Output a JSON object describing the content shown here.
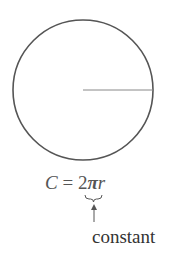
{
  "diagram": {
    "circle": {
      "cx": 83,
      "cy": 90,
      "r": 70,
      "stroke": "#555555"
    },
    "radius_line": {
      "x1": 83,
      "y1": 90,
      "x2": 153,
      "y2": 90,
      "stroke": "#888888"
    },
    "formula": {
      "lhs": "C",
      "equals": " = ",
      "coeff": "2",
      "pi": "π",
      "var": "r"
    },
    "annotation": {
      "label": "constant",
      "brace_under": "2π"
    }
  }
}
